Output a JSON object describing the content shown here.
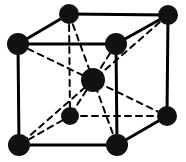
{
  "figure": {
    "name": "body-centered-cubic-unit-cell",
    "type": "crystal-lattice-diagram",
    "title": "",
    "caption": "",
    "background_color": "#ffffff",
    "line_color": "#000000",
    "atom_color": "#111111",
    "width": 186,
    "height": 162
  },
  "chart_data": {
    "type": "diagram",
    "title": "",
    "xlabel": "",
    "ylabel": "",
    "structure": "body-centered cubic (BCC) unit cell",
    "atom_count": 9,
    "corner_atom_count": 8,
    "center_atom_count": 1,
    "projection": "oblique / cabinet projection",
    "depth_offset": {
      "dx": 50,
      "dy": -30
    },
    "atoms": [
      {
        "id": "front-top-left",
        "label": "corner atom",
        "position": "front-top-left",
        "cx": 18,
        "cy": 44,
        "r": 11,
        "layer": "front",
        "kind": "corner"
      },
      {
        "id": "front-top-right",
        "label": "corner atom",
        "position": "front-top-right",
        "cx": 116,
        "cy": 44,
        "r": 11,
        "layer": "front",
        "kind": "corner"
      },
      {
        "id": "front-bottom-left",
        "label": "corner atom",
        "position": "front-bottom-left",
        "cx": 19,
        "cy": 145,
        "r": 11,
        "layer": "front",
        "kind": "corner"
      },
      {
        "id": "front-bottom-right",
        "label": "corner atom",
        "position": "front-bottom-right",
        "cx": 117,
        "cy": 145,
        "r": 11,
        "layer": "front",
        "kind": "corner"
      },
      {
        "id": "back-top-left",
        "label": "corner atom",
        "position": "back-top-left",
        "cx": 69,
        "cy": 14,
        "r": 10,
        "layer": "back",
        "kind": "corner"
      },
      {
        "id": "back-top-right",
        "label": "corner atom",
        "position": "back-top-right",
        "cx": 168,
        "cy": 15,
        "r": 10,
        "layer": "back",
        "kind": "corner"
      },
      {
        "id": "back-bottom-left",
        "label": "corner atom",
        "position": "back-bottom-left",
        "cx": 70,
        "cy": 116,
        "r": 9,
        "layer": "back",
        "kind": "corner"
      },
      {
        "id": "back-bottom-right",
        "label": "corner atom",
        "position": "back-bottom-right",
        "cx": 167,
        "cy": 116,
        "r": 10,
        "layer": "back",
        "kind": "corner"
      },
      {
        "id": "body-center",
        "label": "body-center atom",
        "position": "center",
        "cx": 93,
        "cy": 80,
        "r": 12,
        "layer": "center",
        "kind": "center"
      }
    ],
    "edges": [
      {
        "id": "front-top-edge",
        "from": "front-top-left",
        "to": "front-top-right",
        "style": "solid",
        "width": 3
      },
      {
        "id": "front-bottom-edge",
        "from": "front-bottom-left",
        "to": "front-bottom-right",
        "style": "solid",
        "width": 3
      },
      {
        "id": "front-left-edge",
        "from": "front-top-left",
        "to": "front-bottom-left",
        "style": "solid",
        "width": 3
      },
      {
        "id": "front-right-edge",
        "from": "front-top-right",
        "to": "front-bottom-right",
        "style": "solid",
        "width": 3
      },
      {
        "id": "back-top-edge",
        "from": "back-top-left",
        "to": "back-top-right",
        "style": "solid",
        "width": 3
      },
      {
        "id": "back-right-edge",
        "from": "back-top-right",
        "to": "back-bottom-right",
        "style": "solid",
        "width": 3
      },
      {
        "id": "back-bottom-edge",
        "from": "back-bottom-left",
        "to": "back-bottom-right",
        "style": "dashed",
        "width": 2
      },
      {
        "id": "back-left-edge",
        "from": "back-top-left",
        "to": "back-bottom-left",
        "style": "dashed",
        "width": 2
      },
      {
        "id": "top-left-depth-edge",
        "from": "front-top-left",
        "to": "back-top-left",
        "style": "solid",
        "width": 3
      },
      {
        "id": "top-right-depth-edge",
        "from": "front-top-right",
        "to": "back-top-right",
        "style": "solid",
        "width": 3
      },
      {
        "id": "bottom-right-depth-edge",
        "from": "front-bottom-right",
        "to": "back-bottom-right",
        "style": "solid",
        "width": 3
      },
      {
        "id": "bottom-left-depth-edge",
        "from": "front-bottom-left",
        "to": "back-bottom-left",
        "style": "dashed",
        "width": 2
      }
    ],
    "body_diagonals": [
      {
        "id": "diagonal-ftl-bbr",
        "from": "front-top-left",
        "to": "back-bottom-right",
        "style": "dashed",
        "width": 2
      },
      {
        "id": "diagonal-ftr-bbl",
        "from": "front-top-right",
        "to": "back-bottom-left",
        "style": "dashed",
        "width": 2
      },
      {
        "id": "diagonal-btl-fbr",
        "from": "back-top-left",
        "to": "front-bottom-right",
        "style": "dashed",
        "width": 2
      },
      {
        "id": "diagonal-btr-fbl",
        "from": "back-top-right",
        "to": "front-bottom-left",
        "style": "dashed",
        "width": 2
      }
    ]
  }
}
